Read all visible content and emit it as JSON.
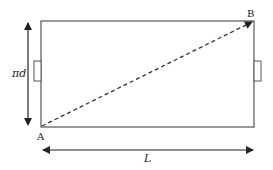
{
  "diagram": {
    "type": "unrolled-cylinder-rectangle",
    "colors": {
      "stroke": "#555555",
      "arrow": "#222222",
      "text": "#222222",
      "background": "#ffffff"
    },
    "rectangle": {
      "x": 41,
      "y": 21,
      "width": 213,
      "height": 106
    },
    "tabs": [
      {
        "side": "left",
        "x": 34,
        "y": 61,
        "width": 7,
        "height": 20
      },
      {
        "side": "right",
        "x": 254,
        "y": 61,
        "width": 7,
        "height": 20
      }
    ],
    "points": {
      "A": {
        "label": "A",
        "x": 41,
        "y": 127
      },
      "B": {
        "label": "B",
        "x": 253,
        "y": 21
      }
    },
    "diagonal": {
      "from": "A",
      "to": "B",
      "style": "dashed"
    },
    "dimensions": {
      "height": {
        "label": "πd",
        "orientation": "vertical",
        "x": 28,
        "y1": 22,
        "y2": 126
      },
      "width": {
        "label": "L",
        "orientation": "horizontal",
        "y": 150,
        "x1": 42,
        "x2": 254
      }
    }
  }
}
